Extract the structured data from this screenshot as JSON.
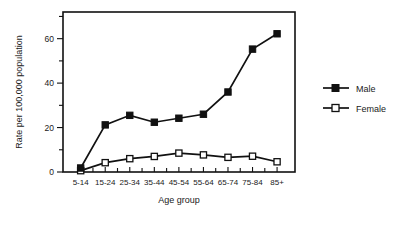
{
  "chart_data": {
    "type": "line",
    "title": "",
    "xlabel": "Age group",
    "ylabel": "Rate per 100,000 population",
    "categories": [
      "5-14",
      "15-24",
      "25-34",
      "35-44",
      "45-54",
      "55-64",
      "65-74",
      "75-84",
      "85+"
    ],
    "series": [
      {
        "name": "Male",
        "marker": "filled-square",
        "values": [
          1.8,
          21.2,
          25.5,
          22.4,
          24.2,
          26.0,
          36.0,
          55.3,
          62.2
        ]
      },
      {
        "name": "Female",
        "marker": "open-square",
        "values": [
          0.6,
          4.2,
          6.0,
          7.0,
          8.5,
          7.7,
          6.6,
          7.1,
          4.6
        ]
      }
    ],
    "ylim": [
      0,
      72
    ],
    "yticks_major": [
      0,
      20,
      40,
      60
    ],
    "yticks_minor": [
      10,
      30,
      50,
      70
    ],
    "ytick_labels": [
      "0",
      "20",
      "40",
      "60"
    ],
    "grid": false,
    "legend_position": "right"
  },
  "legend": {
    "entries": [
      {
        "label": "Male"
      },
      {
        "label": "Female"
      }
    ]
  },
  "axes": {
    "x_title": "Age group",
    "y_title": "Rate per 100,000 population"
  },
  "colors": {
    "line": "#111111",
    "male_marker_fill": "#111111",
    "female_marker_fill": "#ffffff",
    "background": "#ffffff"
  }
}
